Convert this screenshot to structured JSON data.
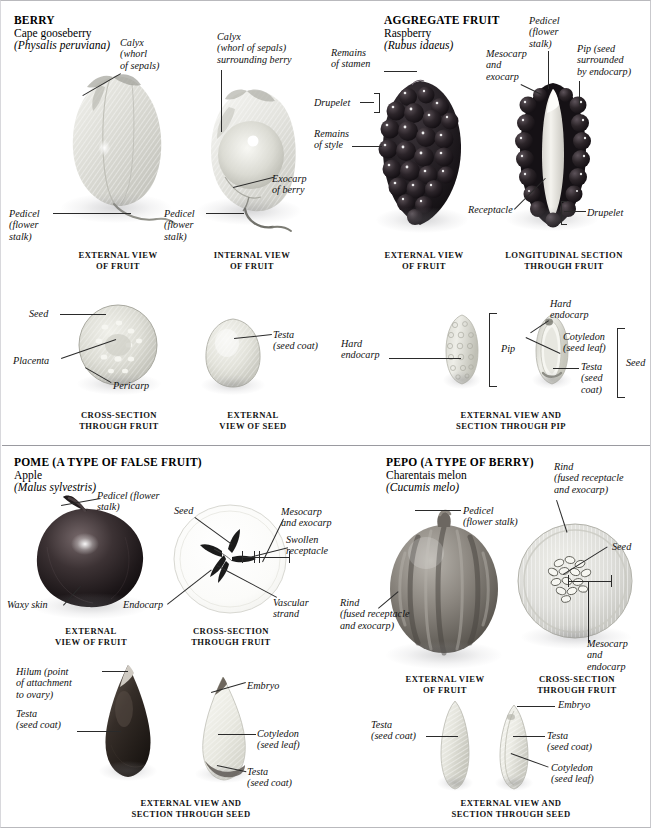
{
  "page": {
    "width": 651,
    "height": 828
  },
  "sections": [
    {
      "id": "berry",
      "heading": "BERRY",
      "common_name": "Cape gooseberry",
      "latin_name": "(Physalis peruviana)",
      "captions": [
        "EXTERNAL VIEW\nOF FRUIT",
        "INTERNAL VIEW\nOF FRUIT",
        "CROSS-SECTION\nTHROUGH FRUIT",
        "EXTERNAL\nVIEW OF SEED"
      ],
      "labels": [
        "Calyx\n(whorl\nof sepals)",
        "Calyx\n(whorl of sepals)\nsurrounding berry",
        "Pedicel\n(flower\nstalk)",
        "Exocarp\nof berry",
        "Seed",
        "Placenta",
        "Pericarp",
        "Testa\n(seed coat)"
      ]
    },
    {
      "id": "aggregate-fruit",
      "heading": "AGGREGATE FRUIT",
      "common_name": "Raspberry",
      "latin_name": "(Rubus idaeus)",
      "captions": [
        "EXTERNAL VIEW\nOF FRUIT",
        "LONGITUDINAL SECTION\nTHROUGH FRUIT",
        "EXTERNAL VIEW AND\nSECTION THROUGH PIP"
      ],
      "labels": [
        "Remains\nof stamen",
        "Drupelet",
        "Remains\nof style",
        "Mesocarp\nand\nexocarp",
        "Pedicel\n(flower\nstalk)",
        "Pip (seed\nsurrounded\nby endocarp)",
        "Receptacle",
        "Drupelet",
        "Hard\nendocarp",
        "Pip",
        "Hard\nendocarp",
        "Cotyledon\n(seed leaf)",
        "Testa\n(seed\ncoat)",
        "Seed"
      ]
    },
    {
      "id": "pome",
      "heading": "POME (A TYPE OF FALSE FRUIT)",
      "common_name": "Apple",
      "latin_name": "(Malus sylvestris)",
      "captions": [
        "EXTERNAL\nVIEW OF FRUIT",
        "CROSS-SECTION\nTHROUGH FRUIT",
        "EXTERNAL VIEW AND\nSECTION THROUGH SEED"
      ],
      "labels": [
        "Pedicel (flower\nstalk)",
        "Seed",
        "Mesocarp\nand exocarp",
        "Swollen\nreceptacle",
        "Waxy skin",
        "Endocarp",
        "Vascular\nstrand",
        "Hilum (point\nof attachment\nto ovary)",
        "Testa\n(seed coat)",
        "Embryo",
        "Cotyledon\n(seed leaf)",
        "Testa\n(seed coat)"
      ]
    },
    {
      "id": "pepo",
      "heading": "PEPO (A TYPE OF BERRY)",
      "common_name": "Charentais melon",
      "latin_name": "(Cucumis melo)",
      "captions": [
        "EXTERNAL VIEW\nOF FRUIT",
        "CROSS-SECTION\nTHROUGH FRUIT",
        "EXTERNAL VIEW AND\nSECTION THROUGH SEED"
      ],
      "labels": [
        "Pedicel\n(flower stalk)",
        "Rind\n(fused receptacle\nand exocarp)",
        "Seed",
        "Rind\n(fused receptacle\nand exocarp)",
        "Mesocarp\nand\nendocarp",
        "Testa\n(seed coat)",
        "Embryo",
        "Testa\n(seed coat)",
        "Cotyledon\n(seed leaf)"
      ]
    }
  ],
  "colors": {
    "page_background": "#ffffff",
    "text": "#111111",
    "leader_line": "#2a2a2a",
    "border": "#b9b9bd"
  }
}
